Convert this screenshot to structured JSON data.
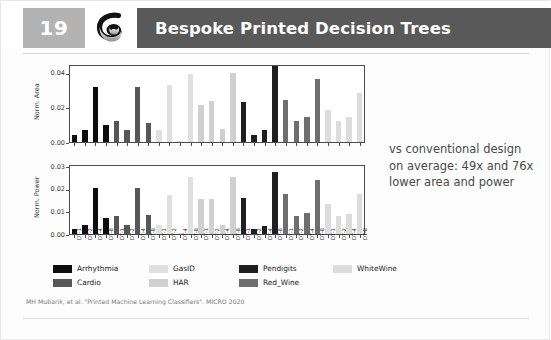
{
  "header": {
    "slide_number": "19",
    "title": "Bespoke Printed Decision Trees",
    "logo_icon": "ribbon-logo-icon",
    "slide_number_bg": "#b3b3b3",
    "title_bar_bg": "#595959"
  },
  "side_note": {
    "line1": "vs conventional design",
    "line2": "on average: 49x and 76x",
    "line3": "lower area and power"
  },
  "footer": {
    "citation": "MH Mubarik, et al. \"Printed Machine Learning Classifiers\". MICRO 2020"
  },
  "legend": {
    "items": [
      {
        "label": "Arrhythmia",
        "color": "#0d0d0d"
      },
      {
        "label": "Cardio",
        "color": "#575757"
      },
      {
        "label": "GasID",
        "color": "#e0e0e0"
      },
      {
        "label": "HAR",
        "color": "#d0d0d0"
      },
      {
        "label": "Pendigits",
        "color": "#1f1f1f"
      },
      {
        "label": "Red_Wine",
        "color": "#6e6e6e"
      },
      {
        "label": "WhiteWine",
        "color": "#dcdcdc"
      }
    ]
  },
  "chart_data": [
    {
      "type": "bar",
      "title": "",
      "xlabel": "",
      "ylabel": "Norm. Area",
      "ylim": [
        0,
        0.045
      ],
      "yticks": [
        0.0,
        0.02,
        0.04
      ],
      "ytick_labels": [
        "0.00",
        "0.02",
        "0.04"
      ],
      "grid": false,
      "legend_position": "below-figure",
      "categories": [
        "DT-1",
        "DT-2",
        "DT-4",
        "DT-8",
        "DT-1",
        "DT-2",
        "DT-4",
        "DT-8",
        "DT-1",
        "DT-2",
        "DT-4",
        "DT-8",
        "DT-1",
        "DT-2",
        "DT-4",
        "DT-8",
        "DT-1",
        "DT-2",
        "DT-4",
        "DT-8",
        "DT-1",
        "DT-2",
        "DT-4",
        "DT-8",
        "DT-1",
        "DT-2",
        "DT-4",
        "DT-8"
      ],
      "group_names": [
        "Arrhythmia",
        "Cardio",
        "GasID",
        "HAR",
        "Pendigits",
        "Red_Wine",
        "WhiteWine"
      ],
      "values": [
        0.0044,
        0.0073,
        0.0325,
        0.0098,
        0.0127,
        0.0074,
        0.0325,
        0.0114,
        0.007,
        0.034,
        0.0007,
        0.04,
        0.022,
        0.0245,
        0.0076,
        0.0406,
        0.0234,
        0.0041,
        0.007,
        0.0452,
        0.025,
        0.0127,
        0.015,
        0.0375,
        0.0192,
        0.0127,
        0.015,
        0.0288
      ],
      "colors": [
        "#0d0d0d",
        "#0d0d0d",
        "#0d0d0d",
        "#0d0d0d",
        "#575757",
        "#575757",
        "#575757",
        "#575757",
        "#e0e0e0",
        "#e0e0e0",
        "#e0e0e0",
        "#e0e0e0",
        "#d0d0d0",
        "#d0d0d0",
        "#d0d0d0",
        "#d0d0d0",
        "#1f1f1f",
        "#1f1f1f",
        "#1f1f1f",
        "#1f1f1f",
        "#6e6e6e",
        "#6e6e6e",
        "#6e6e6e",
        "#6e6e6e",
        "#dcdcdc",
        "#dcdcdc",
        "#dcdcdc",
        "#dcdcdc"
      ]
    },
    {
      "type": "bar",
      "title": "",
      "xlabel": "",
      "ylabel": "Norm. Power",
      "ylim": [
        0,
        0.031
      ],
      "yticks": [
        0.0,
        0.01,
        0.02,
        0.03
      ],
      "ytick_labels": [
        "0.00",
        "0.01",
        "0.02",
        "0.03"
      ],
      "grid": false,
      "legend_position": "below-figure",
      "categories": [
        "DT-1",
        "DT-2",
        "DT-4",
        "DT-8",
        "DT-1",
        "DT-2",
        "DT-4",
        "DT-8",
        "DT-1",
        "DT-2",
        "DT-4",
        "DT-8",
        "DT-1",
        "DT-2",
        "DT-4",
        "DT-8",
        "DT-1",
        "DT-2",
        "DT-4",
        "DT-8",
        "DT-1",
        "DT-2",
        "DT-4",
        "DT-8",
        "DT-1",
        "DT-2",
        "DT-4",
        "DT-8"
      ],
      "group_names": [
        "Arrhythmia",
        "Cardio",
        "GasID",
        "HAR",
        "Pendigits",
        "Red_Wine",
        "WhiteWine"
      ],
      "values": [
        0.0021,
        0.0039,
        0.0209,
        0.0074,
        0.0084,
        0.004,
        0.0209,
        0.0086,
        0.004,
        0.0179,
        0.0004,
        0.0261,
        0.016,
        0.0159,
        0.004,
        0.0261,
        0.0164,
        0.0021,
        0.0037,
        0.0281,
        0.0181,
        0.0082,
        0.0096,
        0.0245,
        0.0137,
        0.0081,
        0.0093,
        0.0181
      ],
      "colors": [
        "#0d0d0d",
        "#0d0d0d",
        "#0d0d0d",
        "#0d0d0d",
        "#575757",
        "#575757",
        "#575757",
        "#575757",
        "#e0e0e0",
        "#e0e0e0",
        "#e0e0e0",
        "#e0e0e0",
        "#d0d0d0",
        "#d0d0d0",
        "#d0d0d0",
        "#d0d0d0",
        "#1f1f1f",
        "#1f1f1f",
        "#1f1f1f",
        "#1f1f1f",
        "#6e6e6e",
        "#6e6e6e",
        "#6e6e6e",
        "#6e6e6e",
        "#dcdcdc",
        "#dcdcdc",
        "#dcdcdc",
        "#dcdcdc"
      ]
    }
  ]
}
